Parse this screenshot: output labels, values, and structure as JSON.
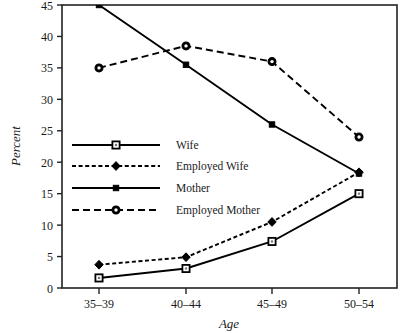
{
  "chart_data": {
    "type": "line",
    "title": "",
    "xlabel": "Age",
    "ylabel": "Percent",
    "categories": [
      "35–39",
      "40–44",
      "45–49",
      "50–54"
    ],
    "ylim": [
      0,
      45
    ],
    "yticks": [
      0,
      5,
      10,
      15,
      20,
      25,
      30,
      35,
      40,
      45
    ],
    "grid": false,
    "legend_position": "center-left inside plot",
    "series": [
      {
        "name": "Wife",
        "values": [
          1.6,
          3.1,
          7.4,
          15.0
        ],
        "line_style": "solid",
        "marker": "open-square",
        "color": "#000000"
      },
      {
        "name": "Employed Wife",
        "values": [
          3.7,
          4.9,
          10.5,
          18.4
        ],
        "line_style": "dotted-dashed",
        "marker": "filled-diamond",
        "color": "#000000"
      },
      {
        "name": "Mother",
        "values": [
          45.0,
          35.5,
          26.0,
          18.2
        ],
        "line_style": "solid",
        "marker": "small-filled-square",
        "color": "#000000"
      },
      {
        "name": "Employed Mother",
        "values": [
          35.0,
          38.5,
          36.0,
          24.0
        ],
        "line_style": "dashed",
        "marker": "open-circle",
        "color": "#000000"
      }
    ]
  },
  "legend": {
    "entries": [
      {
        "label": "Wife"
      },
      {
        "label": "Employed Wife"
      },
      {
        "label": "Mother"
      },
      {
        "label": "Employed Mother"
      }
    ]
  },
  "axes": {
    "y_tick_labels": [
      "0",
      "5",
      "10",
      "15",
      "20",
      "25",
      "30",
      "35",
      "40",
      "45"
    ],
    "x_tick_labels": [
      "35–39",
      "40–44",
      "45–49",
      "50–54"
    ],
    "y_axis_title": "Percent",
    "x_axis_title": "Age"
  },
  "style": {
    "frame_color": "#222222",
    "line_color": "#000000",
    "background": "#ffffff"
  }
}
